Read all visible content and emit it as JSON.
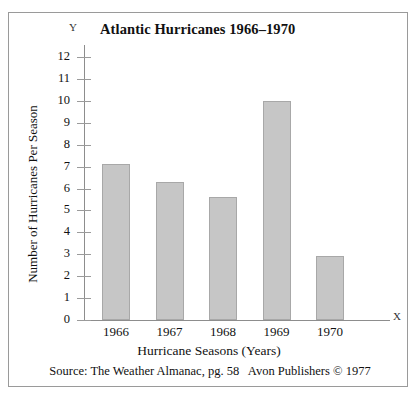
{
  "chart_data": {
    "type": "bar",
    "title": "Atlantic Hurricanes 1966–1970",
    "xlabel": "Hurricane Seasons (Years)",
    "ylabel": "Number of Hurricanes Per Season",
    "categories": [
      "1966",
      "1967",
      "1968",
      "1969",
      "1970"
    ],
    "values": [
      7.1,
      6.3,
      5.6,
      10.0,
      2.9
    ],
    "ylim": [
      0,
      12
    ],
    "ytick_labels": [
      "0",
      "1",
      "2",
      "3",
      "4",
      "5",
      "6",
      "7",
      "8",
      "9",
      "10",
      "11",
      "12"
    ],
    "grid": false,
    "legend": null,
    "series": [
      {
        "name": "Number of Hurricanes Per Season",
        "values": [
          7.1,
          6.3,
          5.6,
          10.0,
          2.9
        ]
      }
    ],
    "axis_markers": {
      "y": "Y",
      "x": "X"
    },
    "bar_fill_color": "#c6c6c6",
    "bar_border_color": "#a8a8a8",
    "axis_color": "#8d8d8d"
  },
  "source": {
    "text": "Source: The Weather Almanac, pg. 58   Avon Publishers © 1977"
  }
}
